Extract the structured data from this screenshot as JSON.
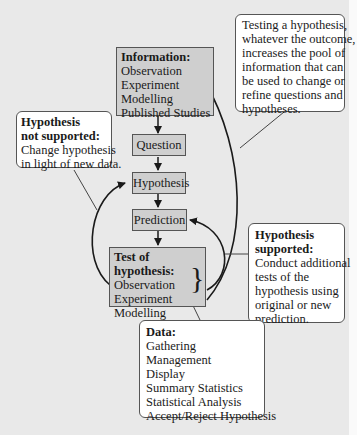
{
  "diagram": {
    "information": {
      "title": "Information:",
      "items": [
        "Observation",
        "Experiment",
        "Modelling",
        "Published Studies"
      ]
    },
    "question": "Question",
    "hypothesis": "Hypothesis",
    "prediction": "Prediction",
    "test": {
      "title": "Test of hypothesis:",
      "items": [
        "Observation",
        "Experiment",
        "Modelling"
      ]
    },
    "callout_testing": {
      "lines": [
        "Testing a hypothesis,",
        "whatever the outcome,",
        "increases the pool of",
        "information that can",
        "be used to change or",
        "refine questions and",
        "hypotheses."
      ]
    },
    "callout_not_supported": {
      "title_lines": [
        "Hypothesis",
        "not supported:"
      ],
      "lines": [
        "Change hypothesis",
        "in light of new data."
      ]
    },
    "callout_supported": {
      "title_lines": [
        "Hypothesis",
        "supported:"
      ],
      "lines": [
        "Conduct additional",
        "tests of the",
        "hypothesis using",
        "original or new",
        "prediction."
      ]
    },
    "callout_data": {
      "title": "Data:",
      "items": [
        "Gathering",
        "Management",
        "Display",
        "Summary Statistics",
        "Statistical Analysis",
        "Accept/Reject Hypothesis"
      ]
    },
    "colors": {
      "background": "#e9e9e9",
      "box_fill": "#cfcfcf",
      "callout_fill": "#ffffff",
      "stroke": "#1a1a1a"
    }
  }
}
